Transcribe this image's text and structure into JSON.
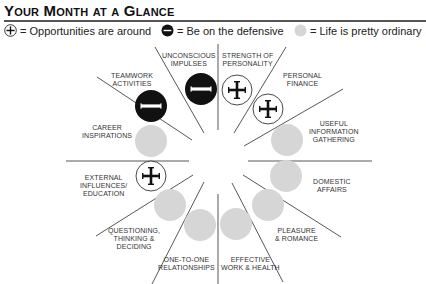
{
  "header": {
    "title": "Your Month at a Glance"
  },
  "legend": [
    {
      "icon": "plus-circle-icon",
      "label": "= Opportunities are around"
    },
    {
      "icon": "minus-circle-icon",
      "label": "= Be on the defensive"
    },
    {
      "icon": "gray-circle-icon",
      "label": "= Life is pretty ordinary"
    }
  ],
  "colors": {
    "black_circle": "#111111",
    "gray_circle": "#d6d6d6",
    "plus_circle_border": "#333333",
    "line": "#444444"
  },
  "sectors": [
    {
      "id": "unconscious",
      "label_lines": [
        "UNCONSCIOUS",
        "IMPULSES"
      ],
      "status": "defensive"
    },
    {
      "id": "strength",
      "label_lines": [
        "STRENGTH OF",
        "PERSONALITY"
      ],
      "status": "opportunity"
    },
    {
      "id": "finance",
      "label_lines": [
        "PERSONAL",
        "FINANCE"
      ],
      "status": "opportunity"
    },
    {
      "id": "useful-info",
      "label_lines": [
        "USEFUL",
        "INFORMATION",
        "GATHERING"
      ],
      "status": "ordinary"
    },
    {
      "id": "domestic",
      "label_lines": [
        "DOMESTIC",
        "AFFAIRS"
      ],
      "status": "ordinary"
    },
    {
      "id": "pleasure",
      "label_lines": [
        "PLEASURE",
        "& ROMANCE"
      ],
      "status": "ordinary"
    },
    {
      "id": "work-health",
      "label_lines": [
        "EFFECTIVE",
        "WORK & HEALTH"
      ],
      "status": "ordinary"
    },
    {
      "id": "one-to-one",
      "label_lines": [
        "ONE-TO-ONE",
        "RELATIONSHIPS"
      ],
      "status": "ordinary"
    },
    {
      "id": "questioning",
      "label_lines": [
        "QUESTIONING,",
        "THINKING &",
        "DECIDING"
      ],
      "status": "ordinary"
    },
    {
      "id": "external",
      "label_lines": [
        "EXTERNAL",
        "INFLUENCES/",
        "EDUCATION"
      ],
      "status": "opportunity"
    },
    {
      "id": "career",
      "label_lines": [
        "CAREER",
        "INSPIRATIONS"
      ],
      "status": "ordinary"
    },
    {
      "id": "teamwork",
      "label_lines": [
        "TEAMWORK",
        "ACTIVITIES"
      ],
      "status": "defensive"
    }
  ]
}
